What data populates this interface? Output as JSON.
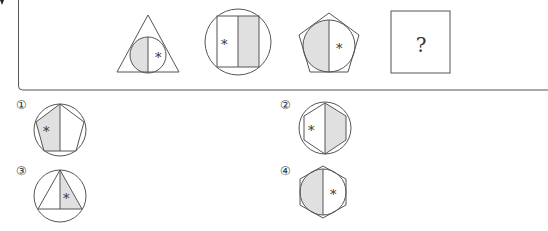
{
  "puzzle": {
    "question_mark": "?",
    "star_symbol": "*",
    "shade_color": "#e0e0e0",
    "line_color": "#555555",
    "sequence": [
      {
        "outer": "triangle",
        "inner": "circle",
        "shaded_half": "left",
        "star_half": "right"
      },
      {
        "outer": "circle",
        "inner": "square",
        "shaded_half": "right",
        "star_half": "left"
      },
      {
        "outer": "pentagon",
        "inner": "circle",
        "shaded_half": "left",
        "star_half": "right"
      },
      {
        "outer": "unknown",
        "label": "?"
      }
    ]
  },
  "options": [
    {
      "label": "①",
      "outer": "circle",
      "inner": "pentagon",
      "shaded_half": "left",
      "star_half": "left"
    },
    {
      "label": "②",
      "outer": "circle",
      "inner": "hexagon",
      "shaded_half": "right",
      "star_half": "left"
    },
    {
      "label": "③",
      "outer": "circle",
      "inner": "triangle",
      "shaded_half": "right",
      "star_half": "right"
    },
    {
      "label": "④",
      "outer": "hexagon",
      "inner": "circle",
      "shaded_half": "left",
      "star_half": "right"
    }
  ]
}
